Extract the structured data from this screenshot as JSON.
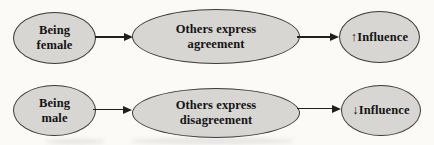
{
  "figure": {
    "type": "path-diagram",
    "rows": [
      {
        "source": {
          "label": "Being\nfemale"
        },
        "mediator": {
          "label": "Others express\nagreement"
        },
        "outcome": {
          "arrow_icon": "up-arrow",
          "arrow": "↑",
          "label": "Influence"
        }
      },
      {
        "source": {
          "label": "Being\nmale"
        },
        "mediator": {
          "label": "Others express\ndisagreement"
        },
        "outcome": {
          "arrow_icon": "down-arrow",
          "arrow": "↓",
          "label": "Influence"
        }
      }
    ],
    "colors": {
      "node_fill": "#d7d6d3",
      "node_stroke": "#3a3a3a",
      "arrow": "#1f1f1f",
      "text": "#141414",
      "background": "#fbfaf7"
    }
  }
}
